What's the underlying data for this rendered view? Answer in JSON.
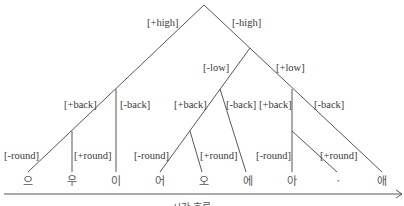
{
  "diagram": {
    "type": "feature-tree",
    "level1": {
      "left": "[+high]",
      "right": "[-high]"
    },
    "level2": {
      "left": "[-low]",
      "right": "[+low]"
    },
    "level3": {
      "high_left": "[+back]",
      "high_right": "[-back]",
      "low_minus_left": "[+back]",
      "low_minus_right": "[-back]",
      "low_plus_left": "[+back]",
      "low_plus_right": "[-back]"
    },
    "level4": {
      "g1_left": "[-round]",
      "g1_right": "[+round]",
      "g2_left": "[-round]",
      "g2_right": "[+round]",
      "g3_left": "[-round]",
      "g3_right": "[+round]"
    },
    "vowels": [
      "으",
      "우",
      "이",
      "어",
      "오",
      "에",
      "아",
      "ㆍ",
      "애"
    ],
    "caption": "시간 흐름"
  }
}
